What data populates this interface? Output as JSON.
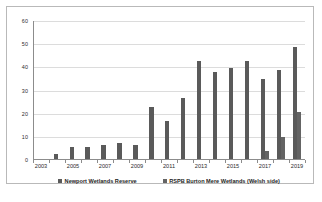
{
  "figure": {
    "background_color": "#ffffff",
    "frame_color": "#b9b9b9"
  },
  "chart_data": {
    "type": "bar",
    "title": "",
    "xlabel": "",
    "ylabel": "Numbers of pairs",
    "ylim": [
      0,
      60
    ],
    "yticks": [
      0,
      10,
      20,
      30,
      40,
      50,
      60
    ],
    "grid": true,
    "legend_position": "bottom",
    "categories": [
      "2003",
      "2004",
      "2005",
      "2006",
      "2007",
      "2008",
      "2009",
      "2010",
      "2011",
      "2012",
      "2013",
      "2014",
      "2015",
      "2016",
      "2017",
      "2018",
      "2019"
    ],
    "tick_labels": [
      "2003",
      "2005",
      "2007",
      "2009",
      "2011",
      "2013",
      "2015",
      "2017",
      "2019"
    ],
    "series": [
      {
        "name": "Newport Wetlands Reserve",
        "color": "#5a5a5a",
        "values": [
          0,
          2,
          5,
          5,
          6,
          7,
          6,
          22.5,
          16.5,
          26.5,
          42.5,
          37.5,
          39.5,
          42.5,
          34.5,
          38.5,
          48.5
        ]
      },
      {
        "name": "RSPB Burton Mere Wetlands (Welsh side)",
        "color": "#646464",
        "values": [
          0,
          0,
          0,
          0,
          0,
          0,
          0,
          0,
          0,
          0,
          0,
          0,
          0,
          0,
          3.5,
          9.5,
          20.5
        ]
      }
    ]
  }
}
